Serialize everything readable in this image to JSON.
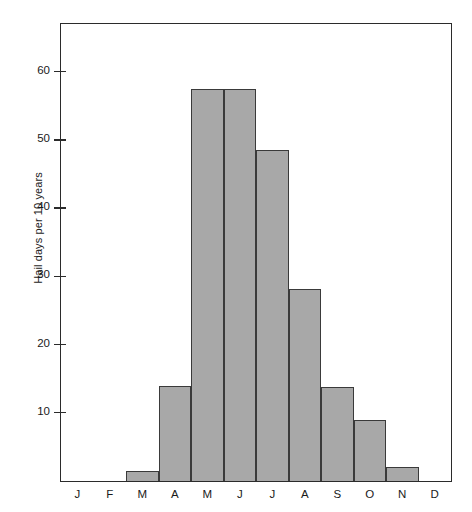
{
  "chart_data": {
    "type": "bar",
    "title": "",
    "xlabel": "",
    "ylabel": "Hail days per 10 years",
    "categories": [
      "J",
      "F",
      "M",
      "A",
      "M",
      "J",
      "J",
      "A",
      "S",
      "O",
      "N",
      "D"
    ],
    "category_names": [
      "January",
      "February",
      "March",
      "April",
      "May",
      "June",
      "July",
      "August",
      "September",
      "October",
      "November",
      "December"
    ],
    "values": [
      0,
      0,
      1.5,
      14,
      57.5,
      57.5,
      48.5,
      28.2,
      13.8,
      8.9,
      2,
      0
    ],
    "ylim": [
      0,
      67
    ],
    "yticks": [
      10,
      20,
      30,
      40,
      50,
      60
    ],
    "ytick_labels": [
      "10",
      "20",
      "30",
      "40",
      "50",
      "60"
    ],
    "grid": false,
    "legend": null,
    "bar_fill_color": "#a8a8a8",
    "bar_edge_color": "#3a3a3a",
    "frame_color": "#2b2b2b",
    "background_color": "#ffffff"
  }
}
